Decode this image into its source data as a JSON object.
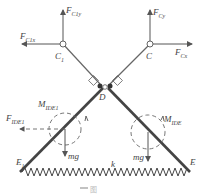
{
  "labels": {
    "F_C1y": {
      "main": "F",
      "sub": "C1y"
    },
    "F_C1x": {
      "main": "F",
      "sub": "C1x"
    },
    "F_Cy": {
      "main": "F",
      "sub": "Cy"
    },
    "F_Cx": {
      "main": "F",
      "sub": "Cx"
    },
    "C1": {
      "main": "C",
      "sub": "1"
    },
    "C": {
      "main": "C"
    },
    "D": {
      "main": "D"
    },
    "M_IDE1": {
      "main": "M",
      "sub": "IDE1"
    },
    "F_IDE1": {
      "main": "F",
      "sub": "IDE1"
    },
    "M_IDE": {
      "main": "M",
      "sub": "IDE"
    },
    "mg_left": {
      "main": "mg"
    },
    "mg_right": {
      "main": "mg"
    },
    "k": {
      "main": "k"
    },
    "E1": {
      "main": "E",
      "sub": "1"
    },
    "E": {
      "main": "E"
    }
  },
  "caption": "图"
}
